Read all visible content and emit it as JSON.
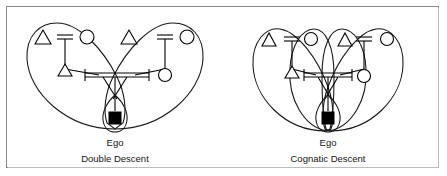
{
  "figure": {
    "type": "kinship-diagram",
    "border_color": "#8a8a8a",
    "background": "#ffffff",
    "line_color": "#000000",
    "symbol_fill": "#ffffff",
    "ego_fill": "#000000"
  },
  "panels": [
    {
      "id": "double-descent",
      "ego_label": "Ego",
      "caption": "Double Descent",
      "symbol_legend": {
        "triangle": "male",
        "circle": "female",
        "filled-square": "ego",
        "double-bar": "marriage",
        "vertical-line": "descent"
      },
      "generation1": [
        {
          "symbol": "triangle",
          "role": "paternal-grandfather"
        },
        {
          "symbol": "circle",
          "role": "paternal-grandmother"
        },
        {
          "symbol": "triangle",
          "role": "maternal-grandfather"
        },
        {
          "symbol": "circle",
          "role": "maternal-grandmother"
        }
      ],
      "generation2": [
        {
          "symbol": "triangle",
          "role": "father"
        },
        {
          "symbol": "circle",
          "role": "mother"
        }
      ],
      "generation3": [
        {
          "symbol": "filled-square",
          "role": "ego"
        }
      ],
      "descent_groups": [
        {
          "name": "patrilineal-loop",
          "side": "left"
        },
        {
          "name": "matrilineal-loop",
          "side": "right"
        }
      ],
      "loop_count": 2
    },
    {
      "id": "cognatic-descent",
      "ego_label": "Ego",
      "caption": "Cognatic Descent",
      "symbol_legend": {
        "triangle": "male",
        "circle": "female",
        "filled-square": "ego",
        "double-bar": "marriage",
        "vertical-line": "descent"
      },
      "generation1": [
        {
          "symbol": "triangle",
          "role": "paternal-grandfather"
        },
        {
          "symbol": "circle",
          "role": "paternal-grandmother"
        },
        {
          "symbol": "triangle",
          "role": "maternal-grandfather"
        },
        {
          "symbol": "circle",
          "role": "maternal-grandmother"
        }
      ],
      "generation2": [
        {
          "symbol": "triangle",
          "role": "father"
        },
        {
          "symbol": "circle",
          "role": "mother"
        }
      ],
      "generation3": [
        {
          "symbol": "filled-square",
          "role": "ego"
        }
      ],
      "descent_groups": [
        {
          "name": "loop-from-paternal-grandfather",
          "side": "outer-left"
        },
        {
          "name": "loop-from-paternal-grandmother",
          "side": "inner-left"
        },
        {
          "name": "loop-from-maternal-grandfather",
          "side": "inner-right"
        },
        {
          "name": "loop-from-maternal-grandmother",
          "side": "outer-right"
        }
      ],
      "loop_count": 4
    }
  ]
}
